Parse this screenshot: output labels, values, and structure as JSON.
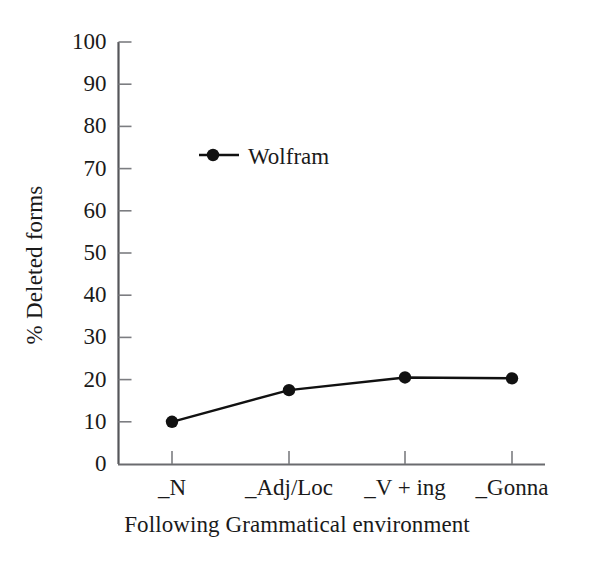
{
  "chart_data": {
    "type": "line",
    "title": "",
    "xlabel": "Following Grammatical environment",
    "ylabel": "% Deleted forms",
    "categories": [
      "_N",
      "_Adj/Loc",
      "_V + ing",
      "_Gonna"
    ],
    "series": [
      {
        "name": "Wolfram",
        "values": [
          10,
          17.5,
          20.5,
          20.3
        ],
        "color": "#111111",
        "marker": "filled-circle"
      }
    ],
    "ylim": [
      0,
      100
    ],
    "yticks": [
      0,
      10,
      20,
      30,
      40,
      50,
      60,
      70,
      80,
      90,
      100
    ],
    "ytick_labels": [
      "0",
      "10",
      "20",
      "30",
      "40",
      "50",
      "60",
      "70",
      "80",
      "90",
      "100"
    ],
    "grid": false,
    "legend_position": "upper-left-inside"
  },
  "legend": {
    "entries": [
      {
        "label": "Wolfram"
      }
    ]
  },
  "axes": {
    "y_title": "% Deleted forms",
    "x_title": "Following Grammatical environment"
  }
}
